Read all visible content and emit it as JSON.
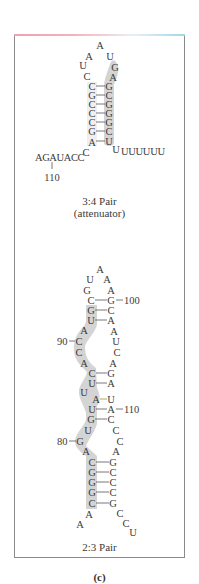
{
  "figure": {
    "panel_label": "(c)",
    "colors": {
      "highlight": "#cfcfcf",
      "text": "#3b3b3b",
      "border": "#8a8a8a"
    }
  },
  "structure_34": {
    "caption_line1": "3:4 Pair",
    "caption_line2": "(attenuator)",
    "loop": [
      {
        "b": "A",
        "x": 100,
        "y": 45
      },
      {
        "b": "A",
        "x": 89,
        "y": 56
      },
      {
        "b": "U",
        "x": 110,
        "y": 56
      },
      {
        "b": "U",
        "x": 83,
        "y": 65
      },
      {
        "b": "G",
        "x": 115,
        "y": 67
      },
      {
        "b": "C",
        "x": 87,
        "y": 76
      },
      {
        "b": "A",
        "x": 113,
        "y": 77
      }
    ],
    "stem_pairs": [
      {
        "l": "C",
        "r": "G",
        "y": 86
      },
      {
        "l": "G",
        "r": "C",
        "y": 95
      },
      {
        "l": "C",
        "r": "G",
        "y": 104
      },
      {
        "l": "C",
        "r": "G",
        "y": 113
      },
      {
        "l": "C",
        "r": "G",
        "y": 122
      },
      {
        "l": "G",
        "r": "C",
        "y": 131
      },
      {
        "l": "A",
        "r": "U",
        "y": 141
      }
    ],
    "tail_3prime": "UUUUUU",
    "tail_3prime_first": "U",
    "tail_5prime": "AGAUACC",
    "tail_5prime_sup": "C",
    "position_label": "110"
  },
  "structure_23": {
    "caption": "2:3 Pair",
    "nucleotides": [
      {
        "b": "A",
        "x": 100,
        "y": 269
      },
      {
        "b": "U",
        "x": 90,
        "y": 279
      },
      {
        "b": "A",
        "x": 107,
        "y": 279
      },
      {
        "b": "G",
        "x": 87,
        "y": 290
      },
      {
        "b": "A",
        "x": 111,
        "y": 290
      },
      {
        "b": "C",
        "x": 91,
        "y": 300
      },
      {
        "b": "G",
        "x": 111,
        "y": 300
      },
      {
        "b": "G",
        "x": 91,
        "y": 310
      },
      {
        "b": "C",
        "x": 111,
        "y": 310
      },
      {
        "b": "U",
        "x": 91,
        "y": 320
      },
      {
        "b": "A",
        "x": 111,
        "y": 320
      },
      {
        "b": "A",
        "x": 84,
        "y": 330
      },
      {
        "b": "A",
        "x": 114,
        "y": 331
      },
      {
        "b": "C",
        "x": 79,
        "y": 341
      },
      {
        "b": "U",
        "x": 116,
        "y": 341
      },
      {
        "b": "C",
        "x": 79,
        "y": 352
      },
      {
        "b": "C",
        "x": 117,
        "y": 352
      },
      {
        "b": "A",
        "x": 84,
        "y": 363
      },
      {
        "b": "A",
        "x": 113,
        "y": 363
      },
      {
        "b": "C",
        "x": 92,
        "y": 373
      },
      {
        "b": "G",
        "x": 111,
        "y": 373
      },
      {
        "b": "U",
        "x": 92,
        "y": 383
      },
      {
        "b": "A",
        "x": 111,
        "y": 383
      },
      {
        "b": "U",
        "x": 84,
        "y": 392
      },
      {
        "b": "A",
        "x": 96,
        "y": 399
      },
      {
        "b": "U",
        "x": 111,
        "y": 399
      },
      {
        "b": "U",
        "x": 92,
        "y": 409
      },
      {
        "b": "A",
        "x": 111,
        "y": 409
      },
      {
        "b": "G",
        "x": 91,
        "y": 419
      },
      {
        "b": "C",
        "x": 111,
        "y": 419
      },
      {
        "b": "U",
        "x": 88,
        "y": 430
      },
      {
        "b": "C",
        "x": 116,
        "y": 430
      },
      {
        "b": "G",
        "x": 80,
        "y": 441
      },
      {
        "b": "C",
        "x": 120,
        "y": 441
      },
      {
        "b": "A",
        "x": 86,
        "y": 451
      },
      {
        "b": "A",
        "x": 116,
        "y": 451
      },
      {
        "b": "C",
        "x": 92,
        "y": 462
      },
      {
        "b": "G",
        "x": 113,
        "y": 462
      },
      {
        "b": "G",
        "x": 92,
        "y": 472
      },
      {
        "b": "C",
        "x": 113,
        "y": 472
      },
      {
        "b": "G",
        "x": 92,
        "y": 482
      },
      {
        "b": "C",
        "x": 113,
        "y": 482
      },
      {
        "b": "G",
        "x": 92,
        "y": 492
      },
      {
        "b": "C",
        "x": 113,
        "y": 492
      },
      {
        "b": "C",
        "x": 92,
        "y": 503
      },
      {
        "b": "G",
        "x": 113,
        "y": 503
      },
      {
        "b": "A",
        "x": 89,
        "y": 514
      },
      {
        "b": "A",
        "x": 80,
        "y": 524
      },
      {
        "b": "C",
        "x": 120,
        "y": 513
      },
      {
        "b": "C",
        "x": 126,
        "y": 523
      },
      {
        "b": "U",
        "x": 133,
        "y": 532
      }
    ],
    "pair_bonds_y": [
      300,
      310,
      320,
      373,
      383,
      399,
      409,
      419,
      462,
      472,
      482,
      492,
      503
    ],
    "position_labels": [
      {
        "text": "100",
        "x": 124,
        "y": 300,
        "side": "right"
      },
      {
        "text": "90",
        "x": 58,
        "y": 341,
        "side": "left"
      },
      {
        "text": "110",
        "x": 124,
        "y": 409,
        "side": "right"
      },
      {
        "text": "80",
        "x": 58,
        "y": 441,
        "side": "left"
      }
    ]
  }
}
